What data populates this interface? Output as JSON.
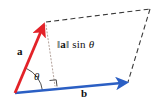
{
  "figure": {
    "background_color": "#ffffff",
    "width": 158,
    "height": 108
  },
  "colors": {
    "vector_a": "#E32228",
    "vector_b": "#2B5FC4",
    "dashed_outline": "#3A3A3A",
    "dotted_height": "#B9A9A2",
    "text": "#111111",
    "arc": "#3A3A3A"
  },
  "labels": {
    "vector_a": "a",
    "vector_b": "b",
    "angle": "θ",
    "height_bar_left": "‖",
    "height_vector": "a",
    "height_bar_right": "‖",
    "height_function": "sin",
    "height_angle": "θ"
  },
  "geometry": {
    "origin": {
      "x": 15,
      "y": 93
    },
    "vector_a_tip": {
      "x": 44,
      "y": 23
    },
    "vector_b_tip": {
      "x": 127,
      "y": 82
    },
    "parallelogram_far_corner": {
      "x": 150,
      "y": 9
    },
    "perpendicular_foot": {
      "x": 55,
      "y": 87
    },
    "right_angle_marker": {
      "x": 55,
      "y": 87,
      "size": 6
    },
    "angle_arc_radius": 26
  },
  "elements": {
    "vector_a_name": "vector-a-arrow",
    "vector_b_name": "vector-b-arrow",
    "height_line_name": "height-dotted-line",
    "parallelogram_name": "parallelogram-dashed-outline",
    "angle_arc_name": "angle-arc",
    "right_angle_name": "right-angle-marker"
  }
}
